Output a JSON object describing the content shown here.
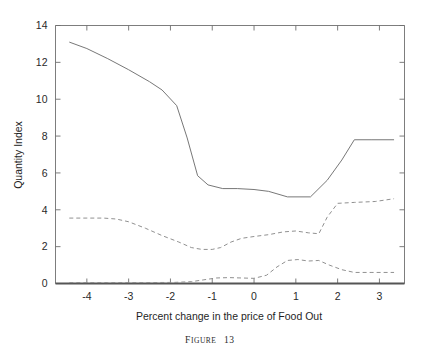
{
  "figure": {
    "caption_prefix": "F",
    "caption_rest": "IGURE",
    "caption_number": "13",
    "caption_full": "FIGURE 13"
  },
  "chart_data": {
    "type": "line",
    "title": "",
    "xlabel": "Percent change in the price of Food Out",
    "ylabel": "Quantity Index",
    "xlim": [
      -4.75,
      3.6
    ],
    "ylim": [
      0,
      14
    ],
    "xticks": [
      -4,
      -3,
      -2,
      -1,
      0,
      1,
      2,
      3
    ],
    "xticklabels": [
      "-4",
      "-3",
      "-2",
      "-1",
      "0",
      "1",
      "2",
      "3"
    ],
    "yticks": [
      0,
      2,
      4,
      6,
      8,
      10,
      12,
      14
    ],
    "yticklabels": [
      "0",
      "2",
      "4",
      "6",
      "8",
      "10",
      "12",
      "14"
    ],
    "grid": false,
    "legend": "none",
    "series": [
      {
        "name": "solid-upper",
        "style": "solid",
        "color": "#707070",
        "x": [
          -4.42,
          -4.0,
          -3.5,
          -3.0,
          -2.5,
          -2.2,
          -1.85,
          -1.6,
          -1.35,
          -1.1,
          -0.75,
          -0.4,
          0.0,
          0.35,
          0.8,
          1.1,
          1.35,
          1.75,
          2.1,
          2.4,
          2.8,
          3.35
        ],
        "y": [
          13.1,
          12.75,
          12.2,
          11.6,
          10.95,
          10.5,
          9.65,
          7.9,
          5.85,
          5.35,
          5.15,
          5.15,
          5.1,
          5.0,
          4.7,
          4.7,
          4.7,
          5.6,
          6.7,
          7.8,
          7.8,
          7.8
        ]
      },
      {
        "name": "dashed-middle",
        "style": "dashed",
        "color": "#8a8a8a",
        "x": [
          -4.42,
          -4.0,
          -3.6,
          -3.3,
          -3.0,
          -2.6,
          -2.2,
          -1.8,
          -1.5,
          -1.25,
          -1.0,
          -0.8,
          -0.55,
          -0.3,
          0.0,
          0.35,
          0.7,
          1.0,
          1.3,
          1.55,
          1.75,
          2.0,
          2.4,
          2.9,
          3.35
        ],
        "y": [
          3.55,
          3.55,
          3.55,
          3.5,
          3.35,
          3.0,
          2.6,
          2.25,
          1.95,
          1.85,
          1.85,
          1.95,
          2.25,
          2.45,
          2.55,
          2.65,
          2.8,
          2.85,
          2.75,
          2.7,
          3.6,
          4.35,
          4.4,
          4.45,
          4.6
        ]
      },
      {
        "name": "dashed-lower",
        "style": "dashed",
        "color": "#8a8a8a",
        "x": [
          -4.42,
          -3.5,
          -2.6,
          -1.9,
          -1.5,
          -1.2,
          -0.9,
          -0.6,
          -0.3,
          0.0,
          0.3,
          0.55,
          0.8,
          1.05,
          1.3,
          1.55,
          1.8,
          2.1,
          2.4,
          2.8,
          3.35
        ],
        "y": [
          0.05,
          0.05,
          0.05,
          0.06,
          0.1,
          0.2,
          0.3,
          0.32,
          0.3,
          0.28,
          0.45,
          0.9,
          1.25,
          1.3,
          1.22,
          1.25,
          1.0,
          0.75,
          0.6,
          0.6,
          0.6
        ]
      }
    ]
  }
}
